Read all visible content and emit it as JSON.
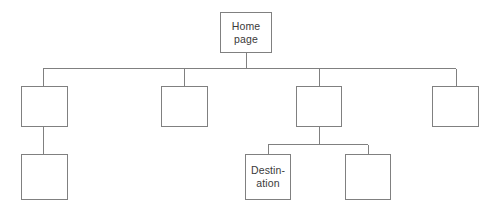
{
  "diagram": {
    "type": "site-map-hierarchy",
    "background_color": "#ffffff",
    "line_color": "#808080",
    "box_border_color": "#808080",
    "box_fill_color": "#ffffff",
    "text_color": "#3a3a3a",
    "nodes": [
      {
        "id": "home",
        "label": "Home\npage",
        "level": 0,
        "x": 220,
        "y": 12,
        "width": 52,
        "height": 41
      },
      {
        "id": "branch1",
        "label": "",
        "level": 1,
        "x": 21,
        "y": 86,
        "width": 47,
        "height": 41
      },
      {
        "id": "branch2",
        "label": "",
        "level": 1,
        "x": 161,
        "y": 86,
        "width": 47,
        "height": 41
      },
      {
        "id": "branch3",
        "label": "",
        "level": 1,
        "x": 296,
        "y": 86,
        "width": 46,
        "height": 41
      },
      {
        "id": "branch4",
        "label": "",
        "level": 1,
        "x": 432,
        "y": 86,
        "width": 47,
        "height": 41
      },
      {
        "id": "branch1-child",
        "label": "",
        "level": 2,
        "x": 21,
        "y": 154,
        "width": 47,
        "height": 46
      },
      {
        "id": "destination",
        "label": "Destin-\nation",
        "level": 2,
        "x": 245,
        "y": 154,
        "width": 46,
        "height": 46
      },
      {
        "id": "branch3-child2",
        "label": "",
        "level": 2,
        "x": 345,
        "y": 154,
        "width": 46,
        "height": 46
      }
    ],
    "connectors": {
      "root_drop": {
        "x": 246,
        "y1": 53,
        "y2": 68
      },
      "main_bus": {
        "y": 68,
        "x1": 43,
        "x2": 456
      },
      "branch_drops": [
        {
          "x": 43,
          "y1": 68,
          "y2": 86
        },
        {
          "x": 184,
          "y1": 68,
          "y2": 86
        },
        {
          "x": 319,
          "y1": 68,
          "y2": 86
        },
        {
          "x": 456,
          "y1": 68,
          "y2": 86
        }
      ],
      "branch1_to_child": {
        "x": 43,
        "y1": 127,
        "y2": 154
      },
      "branch3_drop": {
        "x": 319,
        "y1": 127,
        "y2": 144
      },
      "branch3_bus": {
        "y": 144,
        "x1": 268,
        "x2": 368
      },
      "branch3_child_drops": [
        {
          "x": 268,
          "y1": 144,
          "y2": 154
        },
        {
          "x": 368,
          "y1": 144,
          "y2": 154
        }
      ]
    }
  }
}
